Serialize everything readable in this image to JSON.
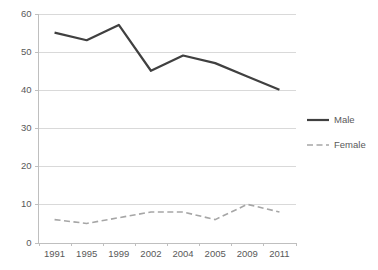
{
  "chart_data": {
    "type": "line",
    "title": "",
    "subtitle": "",
    "xlabel": "",
    "ylabel": "",
    "categories": [
      "1991",
      "1995",
      "1999",
      "2002",
      "2004",
      "2005",
      "2009",
      "2011"
    ],
    "series": [
      {
        "name": "Male",
        "values": [
          55,
          53,
          57,
          45,
          49,
          47,
          43.5,
          40
        ],
        "color": "#404040",
        "style": "solid",
        "width": 2.2
      },
      {
        "name": "Female",
        "values": [
          6,
          5,
          6.5,
          8,
          8,
          6,
          10,
          8
        ],
        "color": "#a6a6a6",
        "style": "dashed",
        "width": 1.6
      }
    ],
    "ylim": [
      0,
      60
    ],
    "yticks": [
      0,
      10,
      20,
      30,
      40,
      50,
      60
    ],
    "ytick_labels": [
      "0",
      "10",
      "20",
      "30",
      "40",
      "50",
      "60"
    ],
    "grid": true,
    "grid_axis": "y",
    "grid_color": "#d9d9d9",
    "axis_color": "#bfbfbf",
    "legend_position": "right",
    "background": "#ffffff",
    "text_color": "#595959"
  },
  "legend": {
    "entries": [
      {
        "label": "Male"
      },
      {
        "label": "Female"
      }
    ]
  }
}
